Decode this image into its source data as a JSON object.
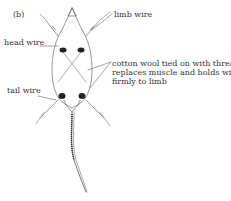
{
  "figure": {
    "panel_label": "(b)",
    "labels": {
      "limb_wire": "limb wire",
      "head_wire": "head wire",
      "tail_wire": "tail wire",
      "cotton_wool": [
        "cotton wool tied on with thread",
        "replaces muscle and holds wire",
        "firmly to limb"
      ]
    },
    "colors": {
      "line": "#555555",
      "text": "#333333",
      "shading": "#222222",
      "background": "#ffffff"
    }
  }
}
